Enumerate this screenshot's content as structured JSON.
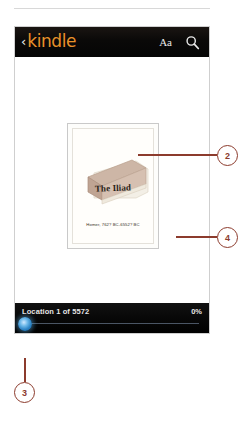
{
  "device": {
    "header": {
      "back_icon": "back-chevron-icon",
      "brand": "kindle",
      "font_button": "Aa",
      "search_icon": "search-icon"
    },
    "book": {
      "title": "The Iliad",
      "author_line": "Homer, 762? BC-6552? BC"
    },
    "status": {
      "location": "Location 1 of 5572",
      "percent": "0%",
      "slider_position_pct": 0
    }
  },
  "callouts": [
    {
      "number": "2"
    },
    {
      "number": "4"
    },
    {
      "number": "3"
    }
  ],
  "colors": {
    "brand_orange": "#e8912a",
    "callout": "#8c3b2d",
    "slider_blue": "#2b82c4",
    "bar_black": "#080808"
  }
}
